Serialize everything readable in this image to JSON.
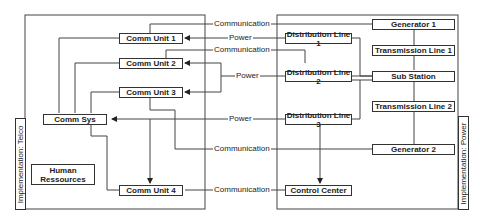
{
  "diagram": {
    "containers": {
      "telco": {
        "label": "Implementation: Telco"
      },
      "power": {
        "label": "Implementation: Power"
      }
    },
    "nodes": {
      "comm_unit_1": "Comm Unit 1",
      "comm_unit_2": "Comm Unit 2",
      "comm_unit_3": "Comm Unit 3",
      "comm_unit_4": "Comm Unit 4",
      "comm_sys": "Comm Sys",
      "human_ressources": "Human Ressources",
      "generator_1": "Generator 1",
      "generator_2": "Generator 2",
      "transmission_line_1": "Transmission Line 1",
      "transmission_line_2": "Transmission Line 2",
      "sub_station": "Sub Station",
      "distribution_line_1": "Distribution Line 1",
      "distribution_line_2": "Distribution Line 2",
      "distribution_line_3": "Distribution Line 3",
      "control_center": "Control Center"
    },
    "edges": [
      {
        "label": "Communication",
        "from": "Generator 1",
        "to": "Comm Unit 1"
      },
      {
        "label": "Power",
        "from": "Distribution Line 1",
        "to": "Comm Unit 1"
      },
      {
        "label": "Communication",
        "from": "Sub Station",
        "to": "Comm Unit 2"
      },
      {
        "label": "Power",
        "from": "Distribution Line 2",
        "to": "Comm Unit 2, Comm Unit 3"
      },
      {
        "label": "Power",
        "from": "Distribution Line 3",
        "to": "Comm Sys"
      },
      {
        "label": "Communication",
        "from": "Generator 2",
        "to": "Comm Unit 3"
      },
      {
        "label": "Communication",
        "from": "Control Center",
        "to": "Comm Unit 4"
      }
    ],
    "edge_labels": {
      "comm1": "Communication",
      "power1": "Power",
      "comm2": "Communication",
      "power2": "Power",
      "power3": "Power",
      "comm3": "Communication",
      "comm4": "Communication"
    }
  }
}
